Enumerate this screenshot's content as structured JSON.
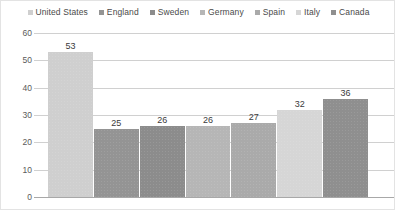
{
  "chart_data": {
    "type": "bar",
    "title": "",
    "xlabel": "",
    "ylabel": "",
    "ylim": [
      0,
      60
    ],
    "yticks": [
      0,
      10,
      20,
      30,
      40,
      50,
      60
    ],
    "grid": true,
    "legend_position": "top",
    "categories": [
      "United States",
      "England",
      "Sweden",
      "Germany",
      "Spain",
      "Italy",
      "Canada"
    ],
    "values": [
      53,
      25,
      26,
      26,
      27,
      32,
      36
    ],
    "value_labels": [
      "53",
      "25",
      "26",
      "26",
      "27",
      "32",
      "36"
    ],
    "ytick_labels": [
      "60",
      "50",
      "40",
      "30",
      "20",
      "10",
      "0"
    ],
    "colors": [
      "#cfcfcf",
      "#949494",
      "#8c8c8c",
      "#b6b6b6",
      "#aaaaaa",
      "#d6d6d6",
      "#8f8f8f"
    ]
  },
  "legend": {
    "items": [
      {
        "label": "United States",
        "color": "#cfcfcf"
      },
      {
        "label": "England",
        "color": "#949494"
      },
      {
        "label": "Sweden",
        "color": "#8c8c8c"
      },
      {
        "label": "Germany",
        "color": "#b6b6b6"
      },
      {
        "label": "Spain",
        "color": "#aaaaaa"
      },
      {
        "label": "Italy",
        "color": "#d6d6d6"
      },
      {
        "label": "Canada",
        "color": "#8f8f8f"
      }
    ]
  },
  "axis": {
    "y_labels": [
      "60",
      "50",
      "40",
      "30",
      "20",
      "10",
      "0"
    ]
  }
}
